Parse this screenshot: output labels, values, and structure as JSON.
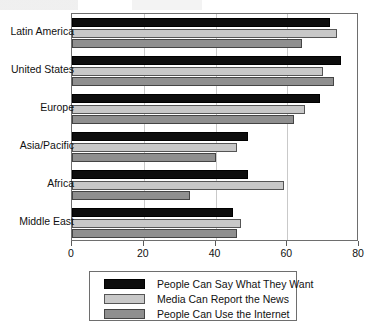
{
  "chart_data": {
    "type": "bar",
    "orientation": "horizontal",
    "title": "",
    "xlabel": "",
    "ylabel": "",
    "xlim": [
      0,
      80
    ],
    "xticks": [
      0,
      20,
      40,
      60,
      80
    ],
    "xtick_labels": [
      "0",
      "20",
      "40",
      "60",
      "80"
    ],
    "grid": true,
    "grid_axis": "x",
    "legend_position": "bottom",
    "categories": [
      "Latin America",
      "United States",
      "Europe",
      "Asia/Pacific",
      "Africa",
      "Middle East"
    ],
    "series": [
      {
        "name": "People Can Say What They Want",
        "color": "#0d0d0d",
        "values": [
          72,
          75,
          69,
          49,
          49,
          45
        ]
      },
      {
        "name": "Media Can Report the News",
        "color": "#c8c8c8",
        "values": [
          74,
          70,
          65,
          46,
          59,
          47
        ]
      },
      {
        "name": "People Can Use the Internet",
        "color": "#8f8f8f",
        "values": [
          64,
          73,
          62,
          40,
          33,
          46
        ]
      }
    ]
  },
  "legend": {
    "entries": [
      "People Can Say What They Want",
      "Media Can Report the News",
      "People Can Use the Internet"
    ]
  }
}
